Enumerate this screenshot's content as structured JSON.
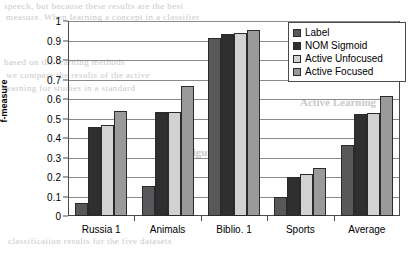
{
  "chart_data": {
    "type": "bar",
    "title": "",
    "xlabel": "",
    "ylabel": "f-measure",
    "ylim": [
      0,
      1
    ],
    "yticks": [
      "0",
      "0.1",
      "0.2",
      "0.3",
      "0.4",
      "0.5",
      "0.6",
      "0.7",
      "0.8",
      "0.9",
      "1"
    ],
    "grid": true,
    "legend_position": "top-right",
    "categories": [
      "Russia 1",
      "Animals",
      "Biblio. 1",
      "Sports",
      "Average"
    ],
    "series": [
      {
        "name": "Label",
        "color": "#58585a",
        "values": [
          0.065,
          0.155,
          0.915,
          0.095,
          0.365
        ]
      },
      {
        "name": "NOM Sigmoid",
        "color": "#2f2f31",
        "values": [
          0.455,
          0.535,
          0.935,
          0.2,
          0.525
        ]
      },
      {
        "name": "Active Unfocused",
        "color": "#d2d2d2",
        "values": [
          0.465,
          0.535,
          0.94,
          0.215,
          0.53
        ]
      },
      {
        "name": "Active Focused",
        "color": "#9a9a9c",
        "values": [
          0.54,
          0.665,
          0.955,
          0.245,
          0.615
        ]
      }
    ]
  },
  "background_text": {
    "line1": "speech, but because these results are the best",
    "line2": "measure. When learning a concept in a classifier",
    "line3": "based on the learning methods",
    "line4": "we compare the results of the active",
    "line5": "learning for studies in a standard",
    "line6": "Figure 4",
    "line7": "Active Learning",
    "line8": "classification results for the five datasets"
  }
}
